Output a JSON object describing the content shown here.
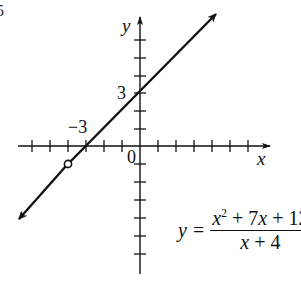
{
  "figure": {
    "corner_label_fragment": "5",
    "axes": {
      "x_label": "x",
      "y_label": "y",
      "origin_label": "0",
      "x_tick_label": "−3",
      "y_tick_label": "3",
      "unit_px": 18,
      "origin_px": [
        140,
        146
      ],
      "x_range": [
        -6.7,
        7.2
      ],
      "y_range": [
        -7.1,
        7.2
      ]
    },
    "equation": {
      "lhs": "y",
      "equals": "=",
      "numerator": {
        "x": "x",
        "exp": "2",
        "rest": " + 7",
        "x2": "x",
        "tail": " + 12"
      },
      "denominator": {
        "x": "x",
        "tail": " + 4"
      }
    },
    "line": {
      "slope": 1,
      "intercept": 3,
      "from": [
        -6.7,
        -3.7
      ],
      "to": [
        4.2,
        7.2
      ]
    },
    "hole": {
      "x": -4,
      "y": -1,
      "style": "open-circle"
    },
    "colors": {
      "ink": "#111111",
      "background": "#ffffff"
    }
  }
}
